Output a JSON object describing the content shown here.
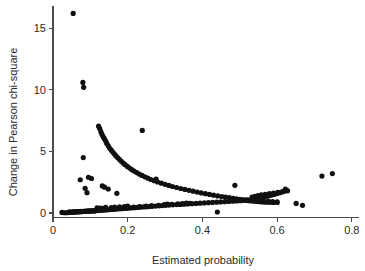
{
  "chart_data": {
    "type": "scatter",
    "title": "",
    "xlabel": "Estimated probability",
    "ylabel": "Change in Pearson chi-square",
    "xlim": [
      0.0,
      0.82
    ],
    "ylim": [
      -0.4,
      16.8
    ],
    "xticks": [
      0,
      0.2,
      0.4,
      0.6,
      0.8
    ],
    "xticklabels": [
      "0",
      "0.2",
      "0.4",
      "0.6",
      "0.8"
    ],
    "yticks": [
      0,
      5,
      10,
      15
    ],
    "yticklabels": [
      "0",
      "5",
      "10",
      "15"
    ],
    "grid": false,
    "legend": null,
    "marker": "filled-circle",
    "marker_color": "#101010",
    "marker_size_px": 2.6,
    "series": [
      {
        "name": "Change in Pearson chi-square vs estimated probability",
        "points": [
          [
            0.054,
            16.2
          ],
          [
            0.08,
            10.6
          ],
          [
            0.082,
            10.2
          ],
          [
            0.081,
            4.5
          ],
          [
            0.073,
            2.7
          ],
          [
            0.095,
            2.9
          ],
          [
            0.103,
            2.8
          ],
          [
            0.086,
            2.0
          ],
          [
            0.091,
            1.65
          ],
          [
            0.132,
            2.2
          ],
          [
            0.138,
            2.1
          ],
          [
            0.148,
            1.95
          ],
          [
            0.171,
            1.6
          ],
          [
            0.239,
            6.7
          ],
          [
            0.276,
            2.75
          ],
          [
            0.487,
            2.25
          ],
          [
            0.622,
            1.95
          ],
          [
            0.72,
            3.0
          ],
          [
            0.748,
            3.2
          ],
          [
            0.668,
            0.62
          ],
          [
            0.651,
            0.78
          ],
          [
            0.44,
            0.08
          ],
          [
            0.024,
            0.05
          ],
          [
            0.122,
            7.05
          ],
          [
            0.125,
            6.85
          ],
          [
            0.128,
            6.6
          ],
          [
            0.131,
            6.4
          ],
          [
            0.134,
            6.2
          ],
          [
            0.137,
            6.05
          ],
          [
            0.141,
            5.85
          ],
          [
            0.144,
            5.65
          ],
          [
            0.148,
            5.45
          ],
          [
            0.152,
            5.25
          ],
          [
            0.156,
            5.1
          ],
          [
            0.16,
            4.95
          ],
          [
            0.164,
            4.8
          ],
          [
            0.168,
            4.65
          ],
          [
            0.173,
            4.5
          ],
          [
            0.178,
            4.35
          ],
          [
            0.183,
            4.2
          ],
          [
            0.188,
            4.05
          ],
          [
            0.193,
            3.92
          ],
          [
            0.199,
            3.78
          ],
          [
            0.205,
            3.65
          ],
          [
            0.211,
            3.52
          ],
          [
            0.217,
            3.4
          ],
          [
            0.224,
            3.28
          ],
          [
            0.231,
            3.16
          ],
          [
            0.238,
            3.05
          ],
          [
            0.246,
            2.94
          ],
          [
            0.254,
            2.83
          ],
          [
            0.262,
            2.72
          ],
          [
            0.271,
            2.62
          ],
          [
            0.28,
            2.52
          ],
          [
            0.29,
            2.42
          ],
          [
            0.3,
            2.33
          ],
          [
            0.31,
            2.24
          ],
          [
            0.32,
            2.15
          ],
          [
            0.331,
            2.07
          ],
          [
            0.342,
            1.99
          ],
          [
            0.353,
            1.91
          ],
          [
            0.364,
            1.84
          ],
          [
            0.375,
            1.77
          ],
          [
            0.386,
            1.7
          ],
          [
            0.397,
            1.63
          ],
          [
            0.408,
            1.57
          ],
          [
            0.419,
            1.51
          ],
          [
            0.43,
            1.45
          ],
          [
            0.441,
            1.39
          ],
          [
            0.452,
            1.34
          ],
          [
            0.462,
            1.29
          ],
          [
            0.472,
            1.24
          ],
          [
            0.482,
            1.19
          ],
          [
            0.491,
            1.15
          ],
          [
            0.5,
            1.11
          ],
          [
            0.509,
            1.07
          ],
          [
            0.517,
            1.04
          ],
          [
            0.525,
            1.01
          ],
          [
            0.532,
            0.98
          ],
          [
            0.539,
            0.96
          ],
          [
            0.546,
            0.94
          ],
          [
            0.553,
            0.92
          ],
          [
            0.56,
            0.9
          ],
          [
            0.567,
            0.89
          ],
          [
            0.574,
            0.88
          ],
          [
            0.581,
            0.87
          ],
          [
            0.59,
            0.86
          ],
          [
            0.6,
            0.86
          ],
          [
            0.031,
            0.02
          ],
          [
            0.037,
            0.03
          ],
          [
            0.042,
            0.04
          ],
          [
            0.047,
            0.05
          ],
          [
            0.052,
            0.06
          ],
          [
            0.057,
            0.07
          ],
          [
            0.062,
            0.08
          ],
          [
            0.067,
            0.09
          ],
          [
            0.072,
            0.1
          ],
          [
            0.077,
            0.11
          ],
          [
            0.082,
            0.12
          ],
          [
            0.087,
            0.13
          ],
          [
            0.092,
            0.15
          ],
          [
            0.097,
            0.16
          ],
          [
            0.102,
            0.17
          ],
          [
            0.107,
            0.18
          ],
          [
            0.112,
            0.19
          ],
          [
            0.117,
            0.2
          ],
          [
            0.122,
            0.21
          ],
          [
            0.128,
            0.22
          ],
          [
            0.134,
            0.23
          ],
          [
            0.14,
            0.25
          ],
          [
            0.146,
            0.26
          ],
          [
            0.152,
            0.28
          ],
          [
            0.158,
            0.29
          ],
          [
            0.164,
            0.3
          ],
          [
            0.17,
            0.32
          ],
          [
            0.176,
            0.34
          ],
          [
            0.183,
            0.35
          ],
          [
            0.19,
            0.37
          ],
          [
            0.197,
            0.38
          ],
          [
            0.204,
            0.4
          ],
          [
            0.211,
            0.42
          ],
          [
            0.218,
            0.43
          ],
          [
            0.226,
            0.45
          ],
          [
            0.234,
            0.47
          ],
          [
            0.242,
            0.49
          ],
          [
            0.25,
            0.5
          ],
          [
            0.258,
            0.52
          ],
          [
            0.266,
            0.54
          ],
          [
            0.275,
            0.56
          ],
          [
            0.284,
            0.58
          ],
          [
            0.293,
            0.6
          ],
          [
            0.302,
            0.62
          ],
          [
            0.311,
            0.64
          ],
          [
            0.321,
            0.66
          ],
          [
            0.331,
            0.68
          ],
          [
            0.341,
            0.7
          ],
          [
            0.351,
            0.72
          ],
          [
            0.361,
            0.74
          ],
          [
            0.372,
            0.76
          ],
          [
            0.383,
            0.78
          ],
          [
            0.394,
            0.8
          ],
          [
            0.405,
            0.82
          ],
          [
            0.416,
            0.84
          ],
          [
            0.427,
            0.86
          ],
          [
            0.438,
            0.88
          ],
          [
            0.449,
            0.9
          ],
          [
            0.46,
            0.92
          ],
          [
            0.471,
            0.94
          ],
          [
            0.482,
            0.96
          ],
          [
            0.492,
            0.98
          ],
          [
            0.502,
            1.0
          ],
          [
            0.512,
            1.03
          ],
          [
            0.521,
            1.06
          ],
          [
            0.53,
            1.09
          ],
          [
            0.539,
            1.13
          ],
          [
            0.547,
            1.17
          ],
          [
            0.555,
            1.22
          ],
          [
            0.563,
            1.27
          ],
          [
            0.57,
            1.32
          ],
          [
            0.577,
            1.38
          ],
          [
            0.584,
            1.44
          ],
          [
            0.591,
            1.5
          ],
          [
            0.598,
            1.57
          ],
          [
            0.605,
            1.63
          ],
          [
            0.612,
            1.7
          ],
          [
            0.619,
            1.76
          ],
          [
            0.626,
            1.83
          ],
          [
            0.118,
            0.42
          ],
          [
            0.126,
            0.4
          ],
          [
            0.133,
            0.38
          ],
          [
            0.141,
            0.45
          ],
          [
            0.156,
            0.43
          ],
          [
            0.165,
            0.47
          ],
          [
            0.178,
            0.5
          ],
          [
            0.191,
            0.52
          ],
          [
            0.2,
            0.55
          ],
          [
            0.216,
            0.48
          ],
          [
            0.232,
            0.52
          ],
          [
            0.249,
            0.57
          ],
          [
            0.264,
            0.6
          ],
          [
            0.283,
            0.62
          ],
          [
            0.298,
            0.68
          ],
          [
            0.306,
            0.72
          ],
          [
            0.318,
            0.7
          ],
          [
            0.334,
            0.74
          ],
          [
            0.347,
            0.76
          ],
          [
            0.357,
            0.8
          ],
          [
            0.366,
            0.78
          ],
          [
            0.044,
            0.1
          ],
          [
            0.049,
            0.08
          ],
          [
            0.055,
            0.11
          ],
          [
            0.06,
            0.09
          ],
          [
            0.065,
            0.12
          ],
          [
            0.07,
            0.1
          ],
          [
            0.075,
            0.14
          ],
          [
            0.08,
            0.12
          ],
          [
            0.085,
            0.15
          ],
          [
            0.09,
            0.13
          ],
          [
            0.095,
            0.17
          ],
          [
            0.1,
            0.15
          ],
          [
            0.106,
            0.18
          ],
          [
            0.111,
            0.16
          ],
          [
            0.555,
            0.95
          ],
          [
            0.566,
            0.93
          ],
          [
            0.577,
            0.95
          ],
          [
            0.588,
            0.92
          ],
          [
            0.6,
            0.9
          ],
          [
            0.5,
            1.06
          ],
          [
            0.508,
            1.04
          ],
          [
            0.516,
            1.02
          ],
          [
            0.524,
            1.0
          ],
          [
            0.533,
            1.3
          ],
          [
            0.541,
            1.35
          ],
          [
            0.549,
            1.42
          ],
          [
            0.558,
            1.48
          ],
          [
            0.568,
            1.52
          ],
          [
            0.579,
            1.58
          ],
          [
            0.59,
            1.62
          ],
          [
            0.602,
            1.68
          ],
          [
            0.614,
            1.72
          ],
          [
            0.628,
            1.8
          ]
        ]
      }
    ]
  }
}
